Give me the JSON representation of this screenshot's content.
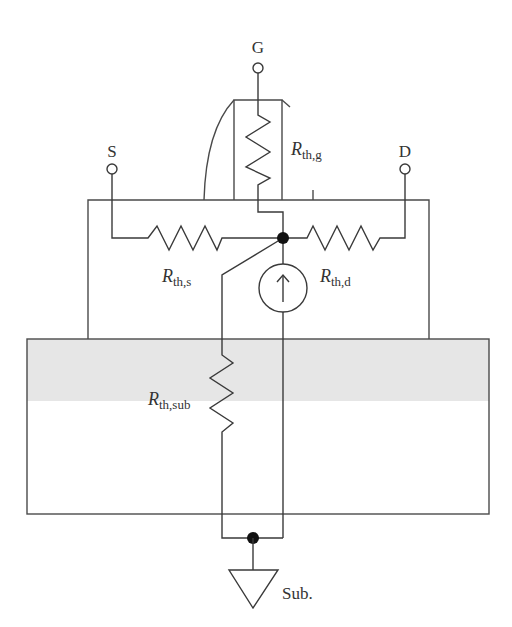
{
  "diagram": {
    "terminals": {
      "gate": "G",
      "source": "S",
      "drain": "D",
      "substrate": "Sub."
    },
    "resistors": {
      "gate": {
        "main": "R",
        "sub": "th,g"
      },
      "source": {
        "main": "R",
        "sub": "th,s"
      },
      "drain": {
        "main": "R",
        "sub": "th,d"
      },
      "substrate": {
        "main": "R",
        "sub": "th,sub"
      }
    },
    "elements": [
      "heat current source",
      "junction node",
      "substrate ground"
    ],
    "colors": {
      "line": "#3a3a3a",
      "substrate_shade": "#e6e6e6",
      "node": "#111111"
    }
  }
}
